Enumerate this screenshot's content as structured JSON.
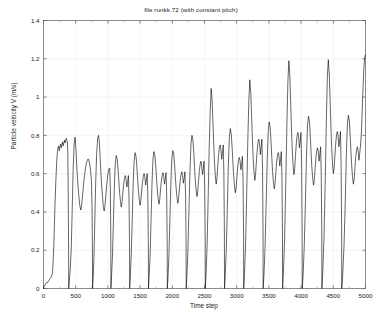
{
  "chart_data": {
    "type": "line",
    "title": "file runkk.72 (with constant pitch)",
    "xlabel": "Time step",
    "ylabel": "Particle velocity V (m/s)",
    "xlim": [
      0,
      5000
    ],
    "ylim": [
      0,
      1.4
    ],
    "xticks": [
      0,
      500,
      1000,
      1500,
      2000,
      2500,
      3000,
      3500,
      4000,
      4500,
      5000
    ],
    "xticklabels": [
      "0",
      "500",
      "1000",
      "1500",
      "2000",
      "2500",
      "3000",
      "3500",
      "4000",
      "4500",
      "5000"
    ],
    "yticks": [
      0,
      0.2,
      0.4,
      0.6,
      0.8,
      1,
      1.2,
      1.4
    ],
    "yticklabels": [
      "0",
      "0.2",
      "0.4",
      "0.6",
      "0.8",
      "1",
      "1.2",
      "1.4"
    ],
    "grid": true,
    "grid_color": "#e8e8e8",
    "line_color": "#000000",
    "line_width": 0.6,
    "legend": null,
    "series": [
      {
        "name": "Particle velocity V",
        "x": [
          0,
          10,
          25,
          40,
          60,
          80,
          100,
          120,
          140,
          160,
          175,
          190,
          205,
          215,
          225,
          235,
          245,
          255,
          265,
          275,
          285,
          295,
          305,
          315,
          325,
          335,
          345,
          355,
          365,
          372,
          378,
          384,
          390,
          392,
          400,
          415,
          430,
          445,
          460,
          475,
          490,
          505,
          520,
          535,
          550,
          565,
          580,
          595,
          610,
          625,
          640,
          655,
          670,
          685,
          700,
          715,
          730,
          745,
          755,
          760,
          762,
          770,
          782,
          795,
          810,
          825,
          840,
          855,
          868,
          880,
          892,
          905,
          918,
          930,
          942,
          955,
          968,
          980,
          992,
          1004,
          1016,
          1028,
          1038,
          1045,
          1047,
          1056,
          1070,
          1085,
          1100,
          1115,
          1130,
          1145,
          1158,
          1170,
          1182,
          1195,
          1208,
          1220,
          1232,
          1245,
          1258,
          1270,
          1282,
          1294,
          1306,
          1318,
          1328,
          1336,
          1338,
          1348,
          1362,
          1377,
          1392,
          1407,
          1422,
          1437,
          1450,
          1462,
          1474,
          1487,
          1500,
          1512,
          1524,
          1537,
          1550,
          1562,
          1574,
          1586,
          1598,
          1610,
          1620,
          1628,
          1630,
          1640,
          1655,
          1670,
          1685,
          1700,
          1715,
          1730,
          1743,
          1755,
          1767,
          1780,
          1793,
          1805,
          1817,
          1830,
          1843,
          1855,
          1867,
          1879,
          1891,
          1903,
          1913,
          1921,
          1923,
          1933,
          1948,
          1963,
          1978,
          1993,
          2008,
          2023,
          2036,
          2048,
          2060,
          2073,
          2086,
          2098,
          2110,
          2123,
          2136,
          2148,
          2160,
          2172,
          2184,
          2196,
          2206,
          2214,
          2216,
          2227,
          2242,
          2258,
          2274,
          2290,
          2305,
          2320,
          2333,
          2345,
          2357,
          2370,
          2383,
          2395,
          2407,
          2420,
          2433,
          2445,
          2457,
          2469,
          2481,
          2493,
          2503,
          2511,
          2513,
          2524,
          2540,
          2556,
          2572,
          2588,
          2603,
          2618,
          2631,
          2643,
          2655,
          2668,
          2681,
          2693,
          2705,
          2718,
          2731,
          2743,
          2755,
          2767,
          2779,
          2791,
          2801,
          2809,
          2811,
          2822,
          2838,
          2854,
          2870,
          2886,
          2901,
          2916,
          2929,
          2941,
          2953,
          2966,
          2979,
          2991,
          3003,
          3016,
          3029,
          3041,
          3053,
          3065,
          3077,
          3089,
          3099,
          3107,
          3109,
          3121,
          3138,
          3155,
          3172,
          3188,
          3203,
          3218,
          3231,
          3243,
          3255,
          3268,
          3281,
          3293,
          3305,
          3318,
          3331,
          3343,
          3355,
          3367,
          3379,
          3391,
          3401,
          3409,
          3411,
          3423,
          3440,
          3457,
          3474,
          3490,
          3505,
          3520,
          3533,
          3545,
          3557,
          3570,
          3583,
          3595,
          3607,
          3620,
          3633,
          3645,
          3657,
          3669,
          3681,
          3693,
          3703,
          3711,
          3713,
          3726,
          3744,
          3762,
          3779,
          3795,
          3810,
          3825,
          3838,
          3850,
          3862,
          3875,
          3888,
          3900,
          3912,
          3925,
          3938,
          3950,
          3962,
          3974,
          3986,
          3998,
          4008,
          4016,
          4018,
          4031,
          4049,
          4067,
          4084,
          4100,
          4115,
          4130,
          4143,
          4155,
          4167,
          4180,
          4193,
          4205,
          4217,
          4230,
          4243,
          4255,
          4267,
          4279,
          4291,
          4303,
          4313,
          4321,
          4323,
          4337,
          4356,
          4375,
          4392,
          4408,
          4423,
          4438,
          4451,
          4463,
          4475,
          4488,
          4501,
          4513,
          4525,
          4538,
          4551,
          4563,
          4575,
          4587,
          4599,
          4611,
          4621,
          4629,
          4631,
          4646,
          4666,
          4686,
          4703,
          4719,
          4734,
          4749,
          4762,
          4774,
          4786,
          4799,
          4812,
          4824,
          4836,
          4849,
          4862,
          4874,
          4886,
          4898,
          4910,
          4922,
          4934,
          4946,
          4958,
          4968,
          4976,
          4984,
          4992,
          5000
        ],
        "y": [
          0.0,
          0.01,
          0.02,
          0.03,
          0.03,
          0.04,
          0.05,
          0.06,
          0.08,
          0.22,
          0.4,
          0.55,
          0.66,
          0.71,
          0.735,
          0.745,
          0.72,
          0.74,
          0.755,
          0.735,
          0.75,
          0.765,
          0.745,
          0.76,
          0.775,
          0.76,
          0.775,
          0.785,
          0.77,
          0.76,
          0.7,
          0.5,
          0.2,
          0.0,
          0.04,
          0.1,
          0.2,
          0.4,
          0.62,
          0.75,
          0.79,
          0.72,
          0.62,
          0.54,
          0.48,
          0.43,
          0.41,
          0.445,
          0.5,
          0.555,
          0.6,
          0.635,
          0.66,
          0.675,
          0.675,
          0.655,
          0.62,
          0.56,
          0.4,
          0.18,
          0.0,
          0.05,
          0.15,
          0.33,
          0.55,
          0.7,
          0.785,
          0.8,
          0.76,
          0.68,
          0.6,
          0.53,
          0.47,
          0.425,
          0.405,
          0.435,
          0.485,
          0.535,
          0.575,
          0.605,
          0.625,
          0.63,
          0.52,
          0.25,
          0.0,
          0.06,
          0.16,
          0.34,
          0.53,
          0.655,
          0.695,
          0.675,
          0.62,
          0.56,
          0.5,
          0.455,
          0.425,
          0.45,
          0.5,
          0.545,
          0.575,
          0.59,
          0.57,
          0.53,
          0.555,
          0.59,
          0.47,
          0.22,
          0.0,
          0.06,
          0.17,
          0.35,
          0.54,
          0.665,
          0.71,
          0.69,
          0.635,
          0.57,
          0.51,
          0.465,
          0.435,
          0.46,
          0.51,
          0.555,
          0.585,
          0.6,
          0.58,
          0.54,
          0.565,
          0.6,
          0.48,
          0.23,
          0.0,
          0.06,
          0.17,
          0.36,
          0.55,
          0.675,
          0.715,
          0.695,
          0.64,
          0.575,
          0.515,
          0.47,
          0.44,
          0.465,
          0.515,
          0.56,
          0.59,
          0.605,
          0.585,
          0.545,
          0.57,
          0.605,
          0.485,
          0.235,
          0.0,
          0.06,
          0.175,
          0.365,
          0.555,
          0.68,
          0.72,
          0.7,
          0.645,
          0.58,
          0.52,
          0.475,
          0.445,
          0.47,
          0.52,
          0.565,
          0.595,
          0.61,
          0.59,
          0.55,
          0.575,
          0.61,
          0.49,
          0.24,
          0.0,
          0.07,
          0.19,
          0.4,
          0.61,
          0.755,
          0.8,
          0.775,
          0.71,
          0.635,
          0.565,
          0.515,
          0.48,
          0.505,
          0.56,
          0.615,
          0.65,
          0.665,
          0.64,
          0.595,
          0.625,
          0.665,
          0.53,
          0.26,
          0.0,
          0.08,
          0.22,
          0.46,
          0.72,
          0.92,
          1.045,
          0.985,
          0.87,
          0.755,
          0.66,
          0.59,
          0.545,
          0.575,
          0.635,
          0.695,
          0.735,
          0.75,
          0.725,
          0.675,
          0.705,
          0.75,
          0.6,
          0.29,
          0.0,
          0.07,
          0.2,
          0.42,
          0.645,
          0.79,
          0.835,
          0.805,
          0.735,
          0.66,
          0.59,
          0.535,
          0.5,
          0.525,
          0.58,
          0.635,
          0.67,
          0.685,
          0.665,
          0.62,
          0.65,
          0.69,
          0.55,
          0.27,
          0.0,
          0.08,
          0.23,
          0.49,
          0.765,
          0.975,
          1.09,
          1.025,
          0.905,
          0.785,
          0.685,
          0.61,
          0.565,
          0.595,
          0.66,
          0.72,
          0.765,
          0.78,
          0.755,
          0.7,
          0.735,
          0.78,
          0.625,
          0.3,
          0.0,
          0.07,
          0.21,
          0.44,
          0.67,
          0.825,
          0.87,
          0.84,
          0.765,
          0.685,
          0.61,
          0.555,
          0.52,
          0.545,
          0.6,
          0.66,
          0.695,
          0.71,
          0.69,
          0.64,
          0.675,
          0.715,
          0.57,
          0.28,
          0.0,
          0.09,
          0.26,
          0.55,
          0.85,
          1.08,
          1.19,
          1.11,
          0.975,
          0.84,
          0.73,
          0.645,
          0.595,
          0.625,
          0.69,
          0.755,
          0.8,
          0.815,
          0.79,
          0.735,
          0.77,
          0.815,
          0.65,
          0.315,
          0.0,
          0.07,
          0.22,
          0.45,
          0.695,
          0.855,
          0.9,
          0.87,
          0.795,
          0.71,
          0.635,
          0.575,
          0.54,
          0.565,
          0.625,
          0.685,
          0.72,
          0.735,
          0.715,
          0.665,
          0.7,
          0.74,
          0.59,
          0.29,
          0.0,
          0.09,
          0.27,
          0.57,
          0.875,
          1.11,
          1.195,
          1.115,
          0.98,
          0.845,
          0.735,
          0.65,
          0.6,
          0.63,
          0.695,
          0.76,
          0.805,
          0.82,
          0.795,
          0.74,
          0.775,
          0.82,
          0.655,
          0.32,
          0.0,
          0.07,
          0.22,
          0.455,
          0.7,
          0.86,
          0.905,
          0.875,
          0.8,
          0.715,
          0.64,
          0.58,
          0.545,
          0.57,
          0.63,
          0.69,
          0.725,
          0.74,
          0.72,
          0.67,
          0.705,
          0.745,
          0.8,
          0.9,
          1.02,
          1.1,
          1.155,
          1.195,
          1.215,
          1.22
        ]
      }
    ]
  }
}
